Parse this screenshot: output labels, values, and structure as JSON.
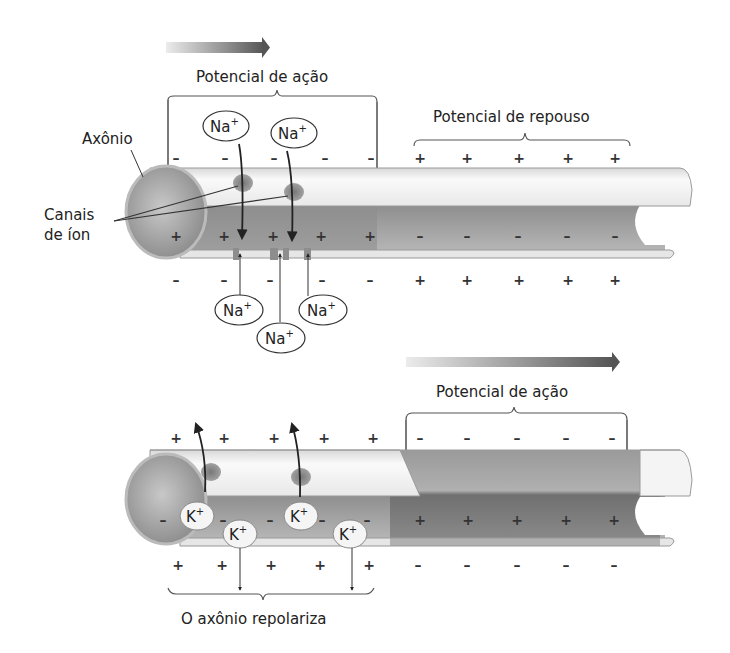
{
  "top_panel": {
    "direction_arrow": "propagation-arrow",
    "action_potential_label": "Potencial de ação",
    "resting_potential_label": "Potencial de repouso",
    "axon_label": "Axônio",
    "ion_channels_label_line1": "Canais",
    "ion_channels_label_line2": "de íon",
    "na_ions_above": [
      "Na",
      "Na"
    ],
    "na_ions_below": [
      "Na",
      "Na",
      "Na"
    ],
    "ion_charge": "+",
    "outside_top_charges": [
      "–",
      "–",
      "–",
      "–",
      "–",
      "+",
      "+",
      "+",
      "+",
      "+"
    ],
    "inside_charges": [
      "+",
      "+",
      "+",
      "+",
      "+",
      "–",
      "–",
      "–",
      "–",
      "–"
    ],
    "outside_bottom_charges": [
      "–",
      "–",
      "–",
      "–",
      "–",
      "+",
      "+",
      "+",
      "+",
      "+"
    ]
  },
  "bottom_panel": {
    "direction_arrow": "propagation-arrow",
    "action_potential_label": "Potencial de ação",
    "repolarize_label": "O axônio repolariza",
    "k_ions": [
      "K",
      "K",
      "K",
      "K"
    ],
    "ion_charge": "+",
    "outside_top_charges": [
      "+",
      "+",
      "+",
      "+",
      "+",
      "–",
      "–",
      "–",
      "–",
      "–"
    ],
    "inside_charges": [
      "–",
      "–",
      "–",
      "–",
      "–",
      "+",
      "+",
      "+",
      "+",
      "+"
    ],
    "outside_bottom_charges": [
      "+",
      "+",
      "+",
      "+",
      "+",
      "–",
      "–",
      "–",
      "–",
      "–"
    ]
  },
  "colors": {
    "arrow_start": "#e6e6e6",
    "arrow_end": "#555555",
    "membrane_light": "#f2f2f2",
    "axoplasm": "#9a9a9a",
    "depolarized": "#7a7a7a",
    "line": "#333333"
  }
}
